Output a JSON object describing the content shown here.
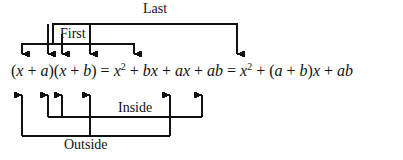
{
  "figure": {
    "background_color": "#ffffff",
    "line_color": "#111111",
    "width": 403,
    "height": 160
  },
  "equation": {
    "full_text": "(x + a)(x + b) = x² + bx + ax + ab = x² + (a + b)x + ab",
    "segments": [
      {
        "id": "lparen1",
        "text": "("
      },
      {
        "id": "term-x1",
        "text": "x"
      },
      {
        "id": "plus1",
        "text": " + "
      },
      {
        "id": "term-a1",
        "text": "a"
      },
      {
        "id": "rparen1",
        "text": ")("
      },
      {
        "id": "term-x2",
        "text": "x"
      },
      {
        "id": "plus2",
        "text": " + "
      },
      {
        "id": "term-b1",
        "text": "b"
      },
      {
        "id": "rparen2",
        "text": ")"
      },
      {
        "id": "equals1",
        "text": " = "
      },
      {
        "id": "term-xsq1",
        "text": "x",
        "superscript": "2"
      },
      {
        "id": "plus3",
        "text": " + "
      },
      {
        "id": "term-bx",
        "text": "bx"
      },
      {
        "id": "plus4",
        "text": " + "
      },
      {
        "id": "term-ax",
        "text": "ax"
      },
      {
        "id": "plus5",
        "text": " + "
      },
      {
        "id": "term-ab1",
        "text": "ab"
      },
      {
        "id": "equals2",
        "text": " = "
      },
      {
        "id": "term-xsq2",
        "text": "x",
        "superscript": "2"
      },
      {
        "id": "plus6",
        "text": " + "
      },
      {
        "id": "group-ab",
        "text": "(a + b)x"
      },
      {
        "id": "plus7",
        "text": " + "
      },
      {
        "id": "term-ab2",
        "text": "ab"
      }
    ]
  },
  "labels": {
    "last": "Last",
    "first": "First",
    "inside": "Inside",
    "outside": "Outside"
  },
  "connectors": {
    "last": {
      "description": "bracket from first x to ab term",
      "bar_y": 24,
      "left_x": 53,
      "right_x": 237,
      "arrow_down_x": 237
    },
    "first": {
      "description": "bracket over first binomial terms to bx",
      "bar_y": 44,
      "left_x": 22,
      "right_x": 134,
      "arrow_down_xs": [
        22,
        48,
        62,
        90,
        134
      ]
    },
    "inside": {
      "description": "bracket under a and x rising to ax",
      "bar_y": 117,
      "left_x": 48,
      "right_x": 202,
      "arrow_up_xs": [
        48,
        62,
        202
      ]
    },
    "outside": {
      "description": "bracket under first x and b rising to ab",
      "bar_y": 136,
      "left_x": 22,
      "right_x": 170,
      "arrow_up_xs": [
        22,
        90,
        170
      ]
    }
  }
}
